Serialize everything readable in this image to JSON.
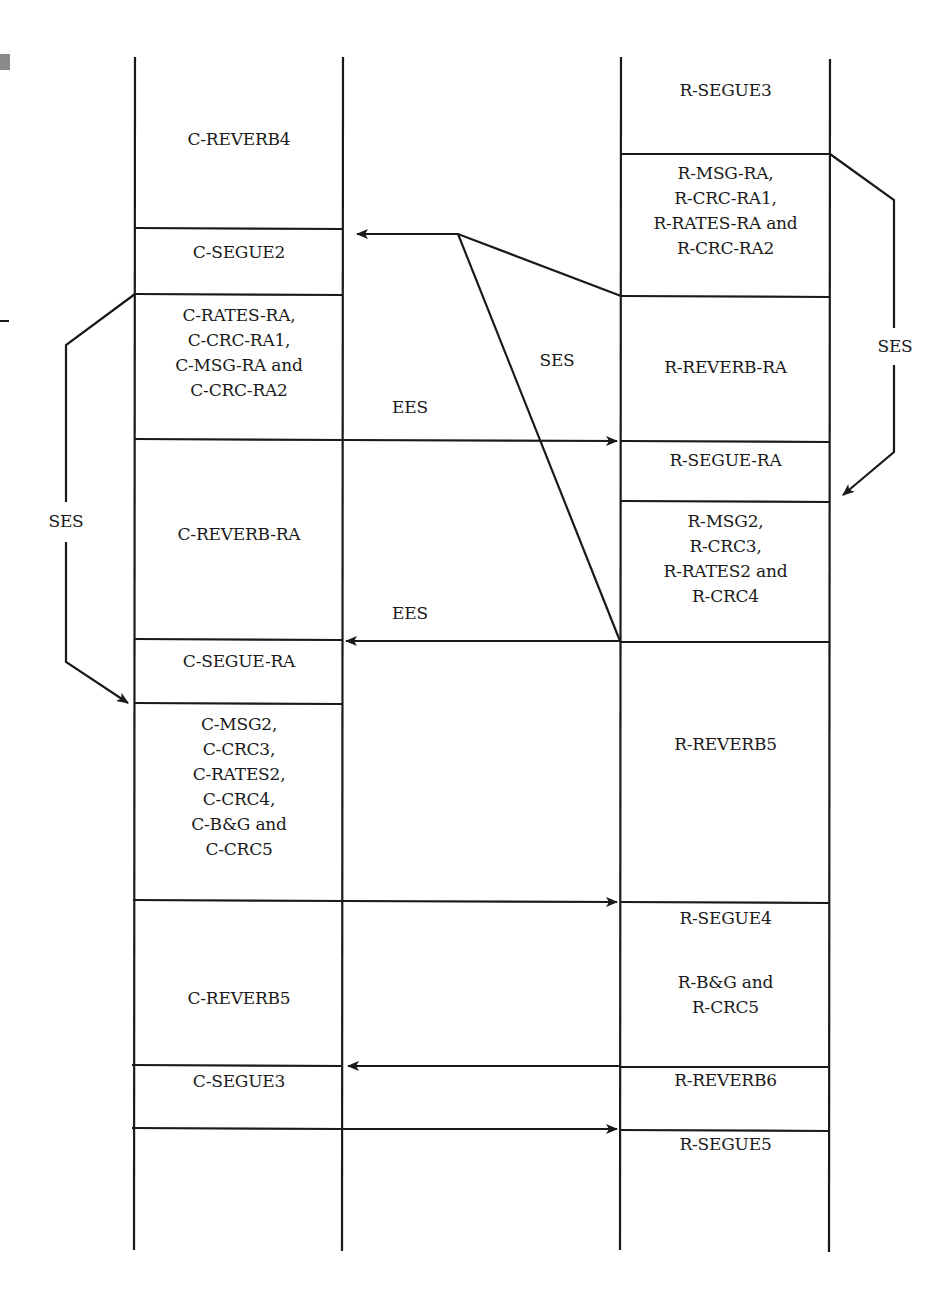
{
  "diagram": {
    "colors": {
      "line": "#1a1a1a",
      "background": "#ffffff",
      "marker": "#8a8a8a"
    },
    "columns": {
      "left": {
        "x1": 135,
        "x2": 343,
        "y_top": 57,
        "y_bottom": 1250
      },
      "right": {
        "x1": 621,
        "x2": 830,
        "y_top": 57,
        "y_bottom": 1250
      }
    },
    "left_blocks": [
      {
        "label": "C-REVERB4",
        "top": 57,
        "bottom": 228,
        "text_y": 127
      },
      {
        "label": "C-SEGUE2",
        "top": 228,
        "bottom": 294,
        "text_y": 240
      },
      {
        "label": "C-RATES-RA,\nC-CRC-RA1,\nC-MSG-RA and\nC-CRC-RA2",
        "top": 294,
        "bottom": 439,
        "text_y": 302
      },
      {
        "label": "C-REVERB-RA",
        "top": 439,
        "bottom": 639,
        "text_y": 521
      },
      {
        "label": "C-SEGUE-RA",
        "top": 639,
        "bottom": 703,
        "text_y": 649
      },
      {
        "label": "C-MSG2,\nC-CRC3,\nC-RATES2,\nC-CRC4,\nC-B&G and\nC-CRC5",
        "top": 703,
        "bottom": 900,
        "text_y": 711
      },
      {
        "label": "C-REVERB5",
        "top": 900,
        "bottom": 1065,
        "text_y": 986
      },
      {
        "label": "C-SEGUE3",
        "top": 1065,
        "bottom": 1130,
        "text_y": 1069
      },
      {
        "label": "",
        "top": 1130,
        "bottom": 1250,
        "text_y": 1140
      }
    ],
    "right_blocks": [
      {
        "label": "R-SEGUE3",
        "top": 57,
        "bottom": 154,
        "text_y": 78
      },
      {
        "label": "R-MSG-RA,\nR-CRC-RA1,\nR-RATES-RA and\nR-CRC-RA2",
        "top": 154,
        "bottom": 296,
        "text_y": 160
      },
      {
        "label": "R-REVERB-RA",
        "top": 296,
        "bottom": 441,
        "text_y": 355
      },
      {
        "label": "R-SEGUE-RA",
        "top": 441,
        "bottom": 501,
        "text_y": 447
      },
      {
        "label": "R-MSG2,\nR-CRC3,\nR-RATES2 and\nR-CRC4",
        "top": 501,
        "bottom": 642,
        "text_y": 508
      },
      {
        "label": "R-REVERB5",
        "top": 642,
        "bottom": 902,
        "text_y": 732
      },
      {
        "label": "R-SEGUE4",
        "top": 902,
        "bottom": 1067,
        "text_y": 906
      },
      {
        "label": "R-B&G and\nR-CRC5",
        "top": 902,
        "bottom": 1067,
        "text_y": 969
      },
      {
        "label": "R-REVERB6",
        "top": 1067,
        "bottom": 1130,
        "text_y": 1068
      },
      {
        "label": "R-SEGUE5",
        "top": 1130,
        "bottom": 1250,
        "text_y": 1133
      }
    ],
    "annotations": [
      {
        "id": "ees-upper",
        "label": "EES",
        "x": 410,
        "y": 395
      },
      {
        "id": "ees-lower",
        "label": "EES",
        "x": 410,
        "y": 603
      },
      {
        "id": "ses-middle",
        "label": "SES",
        "x": 557,
        "y": 348
      },
      {
        "id": "ses-right",
        "label": "SES",
        "x": 895,
        "y": 337
      },
      {
        "id": "ses-left",
        "label": "SES",
        "x": 66,
        "y": 512
      }
    ],
    "arrows": [
      {
        "id": "r-to-c-segue2",
        "from": "R-MSG-RA block end",
        "to": "C-SEGUE2",
        "direction": "left",
        "y": 234
      },
      {
        "id": "c-to-r-ees-1",
        "from": "C-RATES-RA block end",
        "to": "R-SEGUE-RA",
        "direction": "right",
        "y": 441,
        "label": "EES"
      },
      {
        "id": "r-to-c-ees-2",
        "from": "R-MSG2 block end",
        "to": "C-SEGUE-RA",
        "direction": "left",
        "y": 641,
        "label": "EES"
      },
      {
        "id": "c-to-r-segue4",
        "from": "C-MSG2 block end",
        "to": "R-SEGUE4",
        "direction": "right",
        "y": 902
      },
      {
        "id": "r-to-c-segue3",
        "from": "R-B&G block end",
        "to": "C-SEGUE3",
        "direction": "left",
        "y": 1066
      },
      {
        "id": "c-to-r-segue5",
        "from": "C-SEGUE3 block end",
        "to": "R-SEGUE5",
        "direction": "right",
        "y": 1129
      }
    ]
  }
}
